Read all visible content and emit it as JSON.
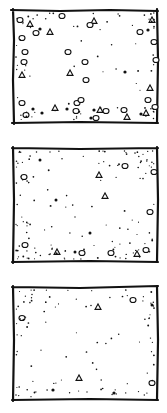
{
  "figure": {
    "panels": [
      {
        "id": "panel-1",
        "bounds": [
          13,
          10,
          157,
          123
        ],
        "density": "high",
        "pebbles": [
          [
            20,
            20,
            3
          ],
          [
            30,
            24,
            3
          ],
          [
            22,
            38,
            3
          ],
          [
            36,
            33,
            3
          ],
          [
            50,
            32,
            3
          ],
          [
            25,
            52,
            3
          ],
          [
            24,
            62,
            3
          ],
          [
            22,
            75,
            3
          ],
          [
            68,
            52,
            3
          ],
          [
            85,
            62,
            3
          ],
          [
            70,
            73,
            3
          ],
          [
            86,
            80,
            3
          ],
          [
            62,
            16,
            3
          ],
          [
            94,
            21,
            3
          ],
          [
            90,
            25,
            3
          ],
          [
            140,
            32,
            3
          ],
          [
            152,
            20,
            3
          ],
          [
            154,
            42,
            3
          ],
          [
            156,
            60,
            3
          ],
          [
            150,
            88,
            3
          ],
          [
            148,
            100,
            3
          ],
          [
            155,
            107,
            3
          ],
          [
            146,
            113,
            3
          ],
          [
            22,
            103,
            3
          ],
          [
            26,
            115,
            3
          ],
          [
            55,
            108,
            3
          ],
          [
            77,
            103,
            3
          ],
          [
            76,
            111,
            3
          ],
          [
            100,
            110,
            3
          ],
          [
            106,
            111,
            3
          ],
          [
            124,
            110,
            3
          ],
          [
            127,
            117,
            3
          ],
          [
            96,
            118,
            3
          ],
          [
            81,
            100,
            3
          ]
        ],
        "blobs": [
          [
            40,
            29,
            1.6
          ],
          [
            125,
            72,
            1.6
          ],
          [
            33,
            109,
            1.6
          ],
          [
            67,
            109,
            1.6
          ],
          [
            94,
            110,
            1.6
          ],
          [
            91,
            118,
            1.6
          ],
          [
            42,
            113,
            1.6
          ],
          [
            148,
            30,
            1.6
          ],
          [
            141,
            114,
            1.6
          ]
        ],
        "dots": 70
      },
      {
        "id": "panel-2",
        "bounds": [
          13,
          148,
          157,
          262
        ],
        "density": "medium",
        "pebbles": [
          [
            24,
            177,
            3
          ],
          [
            99,
            175,
            3
          ],
          [
            125,
            166,
            3
          ],
          [
            154,
            172,
            3
          ],
          [
            105,
            196,
            3
          ],
          [
            150,
            212,
            3
          ],
          [
            25,
            245,
            3
          ],
          [
            57,
            252,
            3
          ],
          [
            82,
            253,
            3
          ],
          [
            111,
            253,
            3
          ],
          [
            137,
            254,
            3
          ],
          [
            146,
            250,
            3
          ]
        ],
        "blobs": [
          [
            40,
            160,
            1.5
          ],
          [
            56,
            200,
            1.5
          ],
          [
            90,
            233,
            1.5
          ],
          [
            75,
            252,
            1.5
          ]
        ],
        "dots": 130
      },
      {
        "id": "panel-3",
        "bounds": [
          13,
          287,
          157,
          400
        ],
        "density": "low",
        "pebbles": [
          [
            22,
            318,
            3
          ],
          [
            98,
            307,
            3
          ],
          [
            133,
            300,
            3
          ],
          [
            152,
            383,
            3
          ],
          [
            79,
            378,
            3
          ]
        ],
        "blobs": [
          [
            152,
            305,
            1.5
          ],
          [
            53,
            390,
            1.6
          ],
          [
            114,
            393,
            1.6
          ]
        ],
        "dots": 95
      }
    ]
  }
}
